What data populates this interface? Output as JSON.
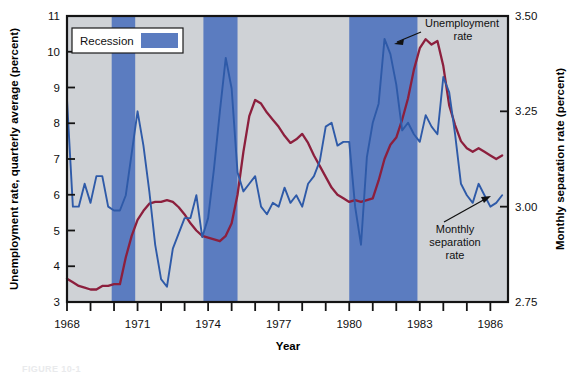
{
  "figure": {
    "caption_partial": "FIGURE 10-1"
  },
  "legend": {
    "label": "Recession",
    "swatch_color": "#5b7cc0",
    "position": "top-left-inside"
  },
  "annotations": [
    {
      "name": "unemployment-rate",
      "lines": [
        "Unemployment",
        "rate"
      ]
    },
    {
      "name": "monthly-separation-rate",
      "lines": [
        "Monthly",
        "separation",
        "rate"
      ]
    }
  ],
  "colors": {
    "plot_background": "#cfd2d6",
    "recession_band": "#5b7cc0",
    "unemployment_line": "#8c1f3d",
    "separation_line": "#2e5aa8",
    "axis": "#141414",
    "page_background": "#ffffff"
  },
  "chart_data": {
    "type": "line",
    "title": "",
    "xlabel": "Year",
    "ylabel": "Unemployment rate, quarterly average (percent)",
    "y2label": "Monthly separation rate (percent)",
    "grid": false,
    "legend_position": "top-left",
    "xlim": [
      1968.0,
      1986.75
    ],
    "ylim": [
      3,
      11
    ],
    "y2lim": [
      2.75,
      3.5
    ],
    "xticks": [
      1968,
      1969,
      1970,
      1971,
      1972,
      1973,
      1974,
      1975,
      1976,
      1977,
      1978,
      1979,
      1980,
      1981,
      1982,
      1983,
      1984,
      1985,
      1986
    ],
    "xtick_labels_shown": [
      "1968",
      "1971",
      "1974",
      "1977",
      "1980",
      "1983",
      "1986"
    ],
    "yticks": [
      3,
      4,
      5,
      6,
      7,
      8,
      9,
      10,
      11
    ],
    "ytick_labels": [
      "3",
      "4",
      "5",
      "6",
      "7",
      "8",
      "9",
      "10",
      "11"
    ],
    "y2ticks": [
      2.75,
      3.0,
      3.25,
      3.5
    ],
    "y2tick_labels": [
      "2.75",
      "3.00",
      "3.25",
      "3.50"
    ],
    "recession_bands": [
      {
        "start": 1969.9,
        "end": 1970.9
      },
      {
        "start": 1973.8,
        "end": 1975.2
      },
      {
        "start": 1980.0,
        "end": 1980.5
      },
      {
        "start": 1981.5,
        "end": 1982.9
      }
    ],
    "recession_bands_drawn": [
      {
        "start": 1969.9,
        "end": 1970.9
      },
      {
        "start": 1973.8,
        "end": 1975.25
      },
      {
        "start": 1980.0,
        "end": 1982.9
      }
    ],
    "series": [
      {
        "name": "Unemployment rate",
        "axis": "left",
        "color": "#8c1f3d",
        "units": "percent",
        "x": [
          1968.0,
          1968.25,
          1968.5,
          1968.75,
          1969.0,
          1969.25,
          1969.5,
          1969.75,
          1970.0,
          1970.25,
          1970.5,
          1970.75,
          1971.0,
          1971.25,
          1971.5,
          1971.75,
          1972.0,
          1972.25,
          1972.5,
          1972.75,
          1973.0,
          1973.25,
          1973.5,
          1973.75,
          1974.0,
          1974.25,
          1974.5,
          1974.75,
          1975.0,
          1975.25,
          1975.5,
          1975.75,
          1976.0,
          1976.25,
          1976.5,
          1976.75,
          1977.0,
          1977.25,
          1977.5,
          1977.75,
          1978.0,
          1978.25,
          1978.5,
          1978.75,
          1979.0,
          1979.25,
          1979.5,
          1979.75,
          1980.0,
          1980.25,
          1980.5,
          1980.75,
          1981.0,
          1981.25,
          1981.5,
          1981.75,
          1982.0,
          1982.25,
          1982.5,
          1982.75,
          1983.0,
          1983.25,
          1983.5,
          1983.75,
          1984.0,
          1984.25,
          1984.5,
          1984.75,
          1985.0,
          1985.25,
          1985.5,
          1985.75,
          1986.0,
          1986.25,
          1986.5
        ],
        "values": [
          3.65,
          3.55,
          3.45,
          3.4,
          3.35,
          3.35,
          3.45,
          3.45,
          3.5,
          3.5,
          4.25,
          4.85,
          5.3,
          5.55,
          5.75,
          5.8,
          5.8,
          5.85,
          5.8,
          5.65,
          5.45,
          5.2,
          5.0,
          4.85,
          4.8,
          4.75,
          4.7,
          4.85,
          5.2,
          6.0,
          7.2,
          8.2,
          8.65,
          8.55,
          8.3,
          8.1,
          7.9,
          7.65,
          7.45,
          7.55,
          7.7,
          7.45,
          7.1,
          6.8,
          6.5,
          6.2,
          6.0,
          5.9,
          5.8,
          5.85,
          5.8,
          5.85,
          5.9,
          6.4,
          7.0,
          7.4,
          7.6,
          8.1,
          8.7,
          9.5,
          10.1,
          10.35,
          10.2,
          10.3,
          9.6,
          8.5,
          7.95,
          7.5,
          7.3,
          7.2,
          7.3,
          7.2,
          7.1,
          7.0,
          7.1
        ]
      },
      {
        "name": "Monthly separation rate",
        "axis": "right",
        "color": "#2e5aa8",
        "units": "percent",
        "x": [
          1968.0,
          1968.25,
          1968.5,
          1968.75,
          1969.0,
          1969.25,
          1969.5,
          1969.75,
          1970.0,
          1970.25,
          1970.5,
          1970.75,
          1971.0,
          1971.25,
          1971.5,
          1971.75,
          1972.0,
          1972.25,
          1972.5,
          1972.75,
          1973.0,
          1973.25,
          1973.5,
          1973.75,
          1974.0,
          1974.25,
          1974.5,
          1974.75,
          1975.0,
          1975.25,
          1975.5,
          1975.75,
          1976.0,
          1976.25,
          1976.5,
          1976.75,
          1977.0,
          1977.25,
          1977.5,
          1977.75,
          1978.0,
          1978.25,
          1978.5,
          1978.75,
          1979.0,
          1979.25,
          1979.5,
          1979.75,
          1980.0,
          1980.25,
          1980.5,
          1980.75,
          1981.0,
          1981.25,
          1981.5,
          1981.75,
          1982.0,
          1982.25,
          1982.5,
          1982.75,
          1983.0,
          1983.25,
          1983.5,
          1983.75,
          1984.0,
          1984.25,
          1984.5,
          1984.75,
          1985.0,
          1985.25,
          1985.5,
          1985.75,
          1986.0,
          1986.25,
          1986.5
        ],
        "values": [
          3.28,
          3.0,
          3.0,
          3.06,
          3.01,
          3.08,
          3.08,
          3.0,
          2.99,
          2.99,
          3.03,
          3.14,
          3.25,
          3.16,
          3.04,
          2.9,
          2.81,
          2.79,
          2.89,
          2.93,
          2.97,
          2.97,
          3.03,
          2.92,
          2.97,
          3.1,
          3.25,
          3.39,
          3.31,
          3.09,
          3.04,
          3.06,
          3.08,
          3.0,
          2.98,
          3.01,
          3.0,
          3.05,
          3.01,
          3.03,
          3.0,
          3.06,
          3.08,
          3.12,
          3.21,
          3.22,
          3.16,
          3.17,
          3.17,
          3.0,
          2.9,
          3.13,
          3.22,
          3.27,
          3.44,
          3.4,
          3.32,
          3.2,
          3.22,
          3.19,
          3.17,
          3.24,
          3.21,
          3.19,
          3.34,
          3.3,
          3.19,
          3.06,
          3.03,
          3.01,
          3.06,
          3.03,
          3.0,
          3.01,
          3.03
        ]
      }
    ]
  }
}
